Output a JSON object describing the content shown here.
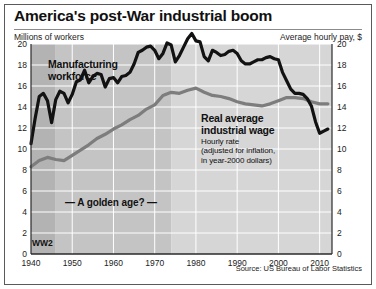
{
  "header": {
    "title": "America's post-War industrial boom",
    "left_axis_label": "Millions of workers",
    "right_axis_label": "Average hourly pay, $"
  },
  "source": "Source: US Bureau of Labor Statistics",
  "annotations": {
    "manufacturing_line1": "Manufacturing",
    "manufacturing_line2": "workforce",
    "wage_line1": "Real average",
    "wage_line2": "industrial wage",
    "wage_sub1": "Hourly rate",
    "wage_sub2": "(adjusted for inflation,",
    "wage_sub3": "in year-2000 dollars)",
    "golden_age": "— A golden age? —",
    "ww2": "WW2"
  },
  "colors": {
    "series_workforce": "#121212",
    "series_wage": "#7d7d7d",
    "band_ww2": "#b3b3b3",
    "band_golden": "#c4c4c4",
    "band_late": "#d6d6d6",
    "gridline": "#ffffff",
    "axis": "#2a2a2a",
    "text": "#111111"
  },
  "chart_data": {
    "type": "line",
    "title": "America's post-War industrial boom",
    "xlabel": "",
    "ylabel": "Millions of workers",
    "y2label": "Average hourly pay, $",
    "xlim": [
      1940,
      2013
    ],
    "ylim": [
      0,
      20
    ],
    "y2lim": [
      0,
      20
    ],
    "yticks": [
      0,
      2,
      4,
      6,
      8,
      10,
      12,
      14,
      16,
      18,
      20
    ],
    "y2ticks": [
      0,
      2,
      4,
      6,
      8,
      10,
      12,
      14,
      16,
      18,
      20
    ],
    "xticks": [
      1940,
      1950,
      1960,
      1970,
      1980,
      1990,
      2000,
      2010
    ],
    "grid": true,
    "legend": "none (inline annotations)",
    "bands": [
      {
        "label": "WW2",
        "from": 1940,
        "to": 1946,
        "shade": "dark"
      },
      {
        "label": "A golden age?",
        "from": 1946,
        "to": 1974,
        "shade": "medium"
      },
      {
        "label": "",
        "from": 1974,
        "to": 2013,
        "shade": "light"
      }
    ],
    "series": [
      {
        "name": "Manufacturing workforce",
        "axis": "left",
        "units": "millions of workers",
        "color": "#121212",
        "x": [
          1940,
          1941,
          1942,
          1943,
          1944,
          1945,
          1946,
          1947,
          1948,
          1949,
          1950,
          1951,
          1952,
          1953,
          1954,
          1955,
          1956,
          1957,
          1958,
          1959,
          1960,
          1961,
          1962,
          1963,
          1964,
          1965,
          1966,
          1967,
          1968,
          1969,
          1970,
          1971,
          1972,
          1973,
          1974,
          1975,
          1976,
          1977,
          1978,
          1979,
          1980,
          1981,
          1982,
          1983,
          1984,
          1985,
          1986,
          1987,
          1988,
          1989,
          1990,
          1991,
          1992,
          1993,
          1994,
          1995,
          1996,
          1997,
          1998,
          1999,
          2000,
          2001,
          2002,
          2003,
          2004,
          2005,
          2006,
          2007,
          2008,
          2009,
          2010,
          2011,
          2012
        ],
        "values": [
          10.5,
          12.9,
          15.0,
          15.3,
          14.6,
          12.5,
          14.7,
          15.5,
          15.3,
          14.4,
          15.2,
          16.4,
          16.6,
          17.5,
          16.3,
          16.9,
          17.2,
          17.1,
          15.9,
          16.7,
          16.8,
          16.3,
          16.9,
          17.0,
          17.3,
          18.1,
          19.2,
          19.4,
          19.7,
          19.8,
          19.4,
          18.6,
          19.1,
          20.1,
          19.9,
          18.3,
          18.9,
          19.7,
          20.5,
          21.0,
          20.3,
          20.2,
          18.8,
          18.4,
          19.4,
          19.2,
          18.9,
          19.0,
          19.3,
          19.4,
          19.1,
          18.4,
          18.1,
          18.1,
          18.3,
          18.5,
          18.5,
          18.7,
          18.8,
          18.6,
          18.5,
          17.3,
          16.5,
          15.7,
          15.3,
          15.3,
          15.2,
          14.8,
          14.1,
          12.6,
          11.5,
          11.7,
          11.9
        ],
        "start_value": 10.5,
        "ww2_peak": 15.3,
        "peak_1979": 21.0,
        "end_value": 11.9
      },
      {
        "name": "Real average industrial wage",
        "axis": "right",
        "units": "dollars per hour, year-2000 dollars",
        "color": "#7d7d7d",
        "x": [
          1940,
          1942,
          1944,
          1946,
          1948,
          1950,
          1952,
          1954,
          1956,
          1958,
          1960,
          1962,
          1964,
          1966,
          1968,
          1970,
          1972,
          1974,
          1976,
          1978,
          1980,
          1982,
          1984,
          1986,
          1988,
          1990,
          1992,
          1994,
          1996,
          1998,
          2000,
          2002,
          2004,
          2006,
          2008,
          2010,
          2012
        ],
        "values": [
          8.3,
          8.9,
          9.2,
          9.0,
          8.9,
          9.4,
          9.9,
          10.4,
          11.0,
          11.4,
          11.9,
          12.3,
          12.8,
          13.2,
          13.8,
          14.2,
          15.1,
          15.4,
          15.3,
          15.6,
          15.8,
          15.4,
          15.1,
          15.0,
          14.8,
          14.5,
          14.3,
          14.2,
          14.1,
          14.3,
          14.6,
          14.9,
          14.9,
          14.8,
          14.5,
          14.3,
          14.3
        ],
        "start_value": 8.3,
        "peak_value": 15.8,
        "end_value": 14.3
      }
    ],
    "notes": [
      "Hourly rate adjusted for inflation, in year-2000 dollars",
      "Lines cross around 2003"
    ]
  }
}
